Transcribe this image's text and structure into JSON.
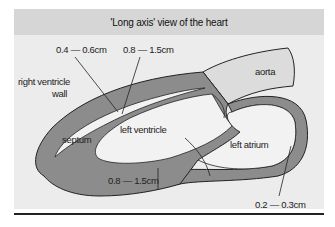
{
  "diagram": {
    "title": "'Long axis' view of the heart",
    "labels": {
      "rv_wall_thickness": "0.4 — 0.6cm",
      "lv_upper_thickness": "0.8 — 1.5cm",
      "rv_wall_line1": "right ventricle",
      "rv_wall_line2": "wall",
      "aorta": "aorta",
      "septum": "septum",
      "left_ventricle": "left ventricle",
      "left_atrium": "left atrium",
      "lv_lower_thickness": "0.8 — 1.5cm",
      "la_wall_thickness": "0.2 — 0.3cm"
    },
    "colors": {
      "panel_bg": "#ececec",
      "header_bg": "#d6d6d6",
      "wall": "#8c8c8c",
      "chamber": "#f2f2f2",
      "aorta": "#dcdcdc",
      "outline": "#222222"
    }
  }
}
